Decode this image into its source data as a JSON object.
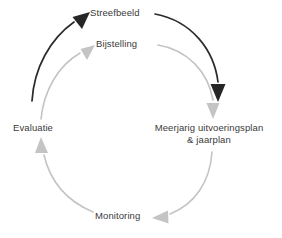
{
  "diagram": {
    "type": "cycle",
    "title": "",
    "colors": {
      "dark_arrow": "#262626",
      "light_arrow": "#bfbfbf",
      "text": "#3a3a3a",
      "background": "#ffffff"
    },
    "nodes": [
      {
        "id": "streefbeeld",
        "label": "Streefbeeld",
        "position": "top"
      },
      {
        "id": "bijstelling",
        "label": "Bijstelling",
        "position": "top-inner"
      },
      {
        "id": "plan",
        "label_line1": "Meerjarig uitvoeringsplan",
        "label_line2": "& jaarplan",
        "position": "right"
      },
      {
        "id": "monitoring",
        "label": "Monitoring",
        "position": "bottom"
      },
      {
        "id": "evaluatie",
        "label": "Evaluatie",
        "position": "left"
      }
    ],
    "arrows": [
      {
        "id": "evaluatie-to-streefbeeld",
        "from": "evaluatie",
        "to": "streefbeeld",
        "style": "dark",
        "emphasis": "high"
      },
      {
        "id": "streefbeeld-to-plan",
        "from": "streefbeeld",
        "to": "plan",
        "style": "dark",
        "emphasis": "high"
      },
      {
        "id": "evaluatie-to-bijstelling",
        "from": "evaluatie",
        "to": "bijstelling",
        "style": "light",
        "emphasis": "low"
      },
      {
        "id": "bijstelling-to-plan",
        "from": "bijstelling",
        "to": "plan",
        "style": "light",
        "emphasis": "low"
      },
      {
        "id": "plan-to-monitoring",
        "from": "plan",
        "to": "monitoring",
        "style": "light",
        "emphasis": "low"
      },
      {
        "id": "monitoring-to-evaluatie",
        "from": "monitoring",
        "to": "evaluatie",
        "style": "light",
        "emphasis": "low"
      }
    ]
  }
}
